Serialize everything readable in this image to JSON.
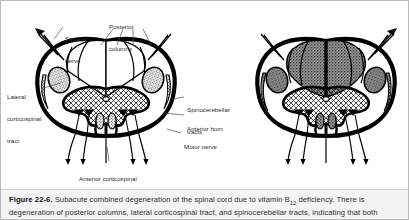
{
  "figure": {
    "number": "Figure 22-6.",
    "caption_text": " Subacute combined degeneration of the spinal cord due to vitamin B12 deficiency. There is degeneration of posterior columns, lateral corticospinal tract, and spinocerebellar tracts, indicating that both",
    "caption_line1": " Subacute combined degeneration of the spinal cord due to vitamin B",
    "caption_sub": "12",
    "caption_line1b": " deficiency. There is",
    "caption_line2": "degeneration of posterior columns, lateral corticospinal tract, and spinocerebellar tracts, indicating that both"
  },
  "labels": {
    "sensory_nerve_l1": "Sensory",
    "sensory_nerve_l2": "nerve",
    "posterior_columns_l1": "Posterior",
    "posterior_columns_l2": "columns",
    "lateral_cst_l1": "Lateral",
    "lateral_cst_l2": "corticospinal",
    "lateral_cst_l3": "tract",
    "spinocerebellar_l1": "Spinocerebellar",
    "spinocerebellar_l2": "tracts",
    "anterior_horn": "Anterior horn",
    "motor_nerve": "Motor nerve",
    "anterior_cst_l1": "Anterior corticospinal",
    "anterior_cst_l2": "tract"
  },
  "colors": {
    "outline": "#000000",
    "degenerated_gray": "#8c8c8c",
    "caption_bg": "#f4f4f4",
    "page_border": "#b9b9b9",
    "text": "#2c2c2c"
  },
  "diagrams": {
    "left": {
      "name": "normal-spinal-cord",
      "degenerated": "false"
    },
    "right": {
      "name": "degenerated-spinal-cord",
      "degenerated": "true"
    }
  }
}
